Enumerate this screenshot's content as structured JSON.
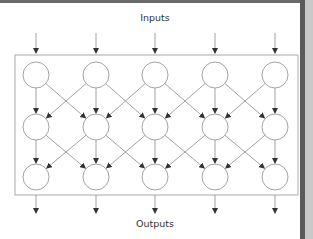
{
  "diagram": {
    "title_top": "Inputs",
    "title_bottom": "Outputs",
    "columns": 5,
    "rows": 3,
    "column_x": [
      36,
      96,
      155,
      215,
      275
    ],
    "row_y": [
      75,
      127,
      177
    ],
    "node_radius": 13,
    "box": {
      "x": 15,
      "y": 55,
      "width": 283,
      "height": 140
    },
    "input_arrow": {
      "y1": 33,
      "y2": 53
    },
    "output_arrow": {
      "y1": 195,
      "y2": 213
    },
    "connections": "each node connects to the node directly below and to diagonal neighbors (crossing pattern) in next row",
    "colors": {
      "stroke": "#9a9a9a",
      "arrow": "#444444",
      "box": "#aaaaaa"
    }
  }
}
